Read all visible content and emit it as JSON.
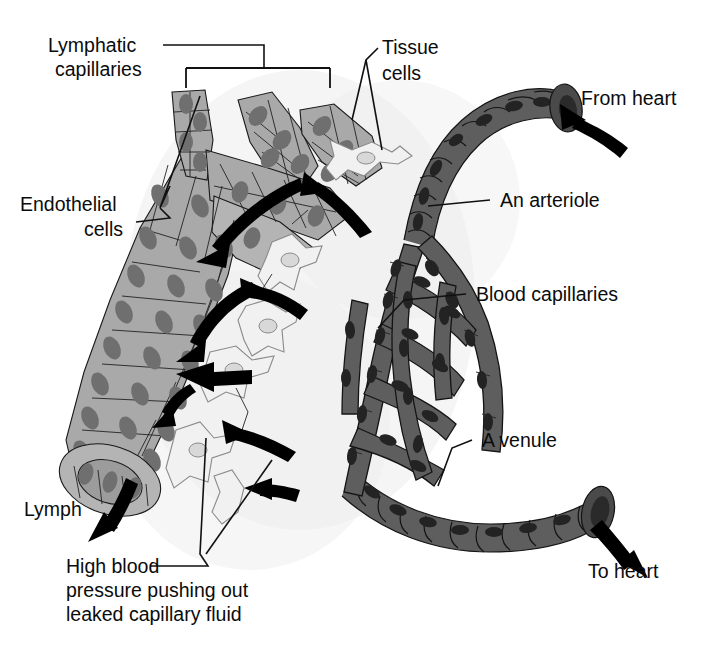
{
  "figure": {
    "background_color": "#ffffff",
    "width": 706,
    "height": 648
  },
  "palette": {
    "lymphatic_cell": "#a9a9a9",
    "lymphatic_nucleus": "#6f6f6f",
    "blood_vessel": "#5e5e5e",
    "blood_vessel_dark": "#4a4a4a",
    "blood_nucleus": "#232323",
    "tissue_cell": "#f1f1f1",
    "outline": "#141414",
    "label_text": "#0b0b0b",
    "arrow": "#000000"
  },
  "labels": {
    "lymphatic_capillaries": {
      "line1": "Lymphatic",
      "line2": "capillaries"
    },
    "tissue_cells": {
      "line1": "Tissue",
      "line2": "cells"
    },
    "from_heart": {
      "line1": "From heart"
    },
    "endothelial_cells": {
      "line1": "Endothelial",
      "line2": "cells"
    },
    "an_arteriole": {
      "line1": "An arteriole"
    },
    "blood_capillaries": {
      "line1": "Blood capillaries"
    },
    "a_venule": {
      "line1": "A venule"
    },
    "lymph": {
      "line1": "Lymph"
    },
    "to_heart": {
      "line1": "To heart"
    },
    "high_blood_pressure": {
      "line1": "High blood",
      "line2": "pressure pushing out",
      "line3": "leaked capillary fluid"
    }
  },
  "structures": [
    {
      "name": "lymphatic-capillary-network",
      "kind": "vessel",
      "shade": "light-gray",
      "description": "Blind-ended finger-like lymphatic capillaries converging into a large trunk at lower left"
    },
    {
      "name": "lymphatic-trunk-opening",
      "kind": "vessel-lumen",
      "description": "Open elliptical mouth of lymphatic trunk at lower left from which lymph drains"
    },
    {
      "name": "arteriole",
      "kind": "vessel",
      "shade": "dark-gray",
      "description": "Thick banded vessel entering at upper right carrying blood from heart"
    },
    {
      "name": "blood-capillary-bed",
      "kind": "vessel-network",
      "shade": "dark-gray",
      "description": "Interconnected mesh of blood capillaries between arteriole and venule"
    },
    {
      "name": "venule",
      "kind": "vessel",
      "shade": "dark-gray",
      "description": "Banded vessel exiting at lower right carrying blood to heart"
    },
    {
      "name": "tissue-cells",
      "kind": "cells",
      "shade": "white-outline",
      "description": "Branched star-shaped tissue cells in interstitial space"
    }
  ],
  "flow_arrows": [
    {
      "name": "fluid-into-lymphatic-top",
      "from": "interstitial space",
      "to": "lymphatic capillary"
    },
    {
      "name": "fluid-into-lymphatic-middle",
      "from": "interstitial space",
      "to": "lymphatic capillary"
    },
    {
      "name": "fluid-into-lymphatic-lower",
      "from": "interstitial space",
      "to": "lymphatic capillary"
    },
    {
      "name": "fluid-out-of-blood-capillary-upper",
      "from": "blood capillary",
      "to": "interstitial space"
    },
    {
      "name": "fluid-out-of-blood-capillary-lower",
      "from": "blood capillary",
      "to": "interstitial space"
    },
    {
      "name": "lymph-outflow",
      "from": "lymphatic trunk",
      "to": "lymph"
    },
    {
      "name": "blood-inflow-from-heart",
      "from": "heart",
      "to": "arteriole"
    },
    {
      "name": "blood-outflow-to-heart",
      "from": "venule",
      "to": "heart"
    }
  ]
}
